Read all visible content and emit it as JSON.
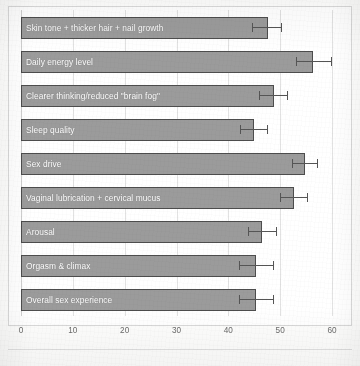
{
  "chart_data": {
    "type": "bar",
    "orientation": "horizontal",
    "title": "",
    "subtitle": "",
    "xlabel": "",
    "ylabel": "",
    "xlim": [
      0,
      60
    ],
    "xticks": [
      0,
      10,
      20,
      30,
      40,
      50,
      60
    ],
    "xtick_labels": [
      "0",
      "10",
      "20",
      "30",
      "40",
      "50",
      "60"
    ],
    "grid": true,
    "grid_axis": "x",
    "legend": false,
    "legend_position": "none",
    "categories": [
      "Skin tone + thicker hair + nail growth",
      "Daily energy level",
      "Clearer thinking/reduced \"brain fog\"",
      "Sleep quality",
      "Sex drive",
      "Vaginal lubrication + cervical mucus",
      "Arousal",
      "Orgasm & climax",
      "Overall sex experience"
    ],
    "values": [
      47.7,
      56.4,
      48.8,
      45.0,
      54.8,
      52.7,
      46.5,
      45.4,
      45.4
    ],
    "error_low": [
      44.5,
      53.0,
      46.0,
      42.3,
      52.2,
      50.0,
      43.7,
      42.0,
      42.0
    ],
    "error_high": [
      50.4,
      60.0,
      51.5,
      47.7,
      57.3,
      55.4,
      49.4,
      48.8,
      48.8
    ],
    "bar_color": "#9b9b9b",
    "bar_edge_color": "#4d4d4d",
    "error_bar_color": "#555555",
    "label_text_color": "#ffffff",
    "gridline_color": "#e2e2e2",
    "plot_border_color": "#d9d9d9",
    "background_color": "#ffffff"
  }
}
